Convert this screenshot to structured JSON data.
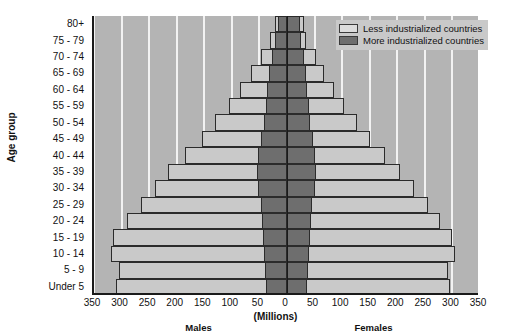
{
  "chart_data": {
    "type": "bar",
    "subtype": "population-pyramid",
    "title": "",
    "xlabel": "(Millions)",
    "ylabel": "Age group",
    "xlim": [
      -350,
      350
    ],
    "xticks": [
      -350,
      -300,
      -250,
      -200,
      -150,
      -100,
      -50,
      0,
      50,
      100,
      150,
      200,
      250,
      300,
      350
    ],
    "xticklabels": [
      "350",
      "300",
      "250",
      "200",
      "150",
      "100",
      "50",
      "0",
      "50",
      "100",
      "150",
      "200",
      "250",
      "300",
      "350"
    ],
    "grid": true,
    "grid_axis": "x",
    "legend_position": "top-right",
    "legend": [
      "Less industrialized countries",
      "More industrialized countries"
    ],
    "side_labels": {
      "left": "Males",
      "right": "Females"
    },
    "categories": [
      "Under 5",
      "5 - 9",
      "10 - 14",
      "15 - 19",
      "20 - 24",
      "25 - 29",
      "30 - 34",
      "35 - 39",
      "40 - 44",
      "45 - 49",
      "50 - 54",
      "55 - 59",
      "60 - 64",
      "65 - 69",
      "70 - 74",
      "75 - 79",
      "80+"
    ],
    "series": [
      {
        "name": "Less industrialized countries",
        "color": "#c9c9c9",
        "males": [
          310,
          305,
          320,
          315,
          290,
          265,
          240,
          215,
          185,
          155,
          130,
          105,
          85,
          65,
          48,
          30,
          22
        ],
        "females": [
          295,
          292,
          305,
          300,
          278,
          255,
          230,
          205,
          178,
          150,
          127,
          103,
          85,
          67,
          52,
          35,
          30
        ]
      },
      {
        "name": "More industrialized countries",
        "color": "#6e6e6e",
        "males": [
          38,
          40,
          42,
          44,
          45,
          48,
          52,
          55,
          52,
          48,
          42,
          38,
          36,
          33,
          28,
          22,
          16
        ],
        "females": [
          36,
          38,
          40,
          42,
          43,
          46,
          50,
          53,
          51,
          47,
          42,
          39,
          37,
          35,
          31,
          26,
          24
        ]
      }
    ]
  },
  "legend": {
    "items": [
      {
        "label": "Less industrialized countries",
        "color": "#c9c9c9"
      },
      {
        "label": "More industrialized countries",
        "color": "#6e6e6e"
      }
    ]
  },
  "axes": {
    "y_title": "Age group",
    "x_title": "(Millions)",
    "left_group": "Males",
    "right_group": "Females"
  }
}
